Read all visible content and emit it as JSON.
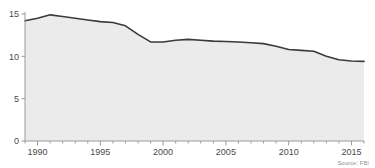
{
  "chart_data": {
    "type": "area",
    "title": "",
    "subtitle": "",
    "xlabel": "",
    "ylabel": "",
    "xlim": [
      1989,
      2016
    ],
    "ylim": [
      0,
      15
    ],
    "grid": false,
    "legend": null,
    "source_note": "Source: FBI",
    "y_ticks": [
      "0",
      "5",
      "10",
      "15"
    ],
    "y_tick_values": [
      0,
      5,
      10,
      15
    ],
    "x_ticks": [
      "1990",
      "1995",
      "2000",
      "2005",
      "2010",
      "2015"
    ],
    "x_tick_values": [
      1990,
      1995,
      2000,
      2005,
      2010,
      2015
    ],
    "x_minor_step": 1,
    "series": [
      {
        "name": "rate",
        "x": [
          1989,
          1990,
          1991,
          1992,
          1993,
          1994,
          1995,
          1996,
          1997,
          1998,
          1999,
          2000,
          2001,
          2002,
          2003,
          2004,
          2005,
          2006,
          2007,
          2008,
          2009,
          2010,
          2011,
          2012,
          2013,
          2014,
          2015,
          2016
        ],
        "values": [
          14.2,
          14.5,
          14.9,
          14.7,
          14.5,
          14.3,
          14.1,
          14.0,
          13.6,
          12.6,
          11.7,
          11.7,
          11.9,
          12.0,
          11.9,
          11.8,
          11.75,
          11.7,
          11.6,
          11.5,
          11.2,
          10.8,
          10.7,
          10.6,
          10.0,
          9.6,
          9.45,
          9.4
        ]
      }
    ],
    "colors": {
      "area_fill": "#ebebeb",
      "line": "#3a3a3a",
      "axis": "#9a9a9a",
      "tick_label": "#4a4a4a",
      "source_text": "#8a8a8a",
      "background": "#ffffff"
    },
    "cropped_title_remnant": ""
  },
  "axes": {
    "y_axis_label": "",
    "x_axis_label": ""
  }
}
